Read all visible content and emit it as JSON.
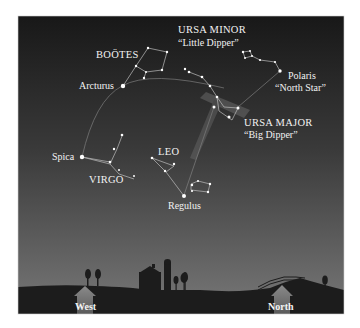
{
  "diagram": {
    "type": "star-chart",
    "colors": {
      "sky_top": "#1a1a1a",
      "sky_bottom": "#6e6e6e",
      "ground": "#1c1c1c",
      "star": "#ffffff",
      "line": "#9a9a9a",
      "arrow": "#7a7a7a"
    },
    "labels": {
      "bootes": "BOÖTES",
      "arcturus": "Arcturus",
      "ursa_minor": "URSA MINOR",
      "little_dipper": "“Little Dipper”",
      "polaris": "Polaris",
      "north_star": "“North Star”",
      "ursa_major": "URSA MAJOR",
      "big_dipper": "“Big Dipper”",
      "spica": "Spica",
      "virgo": "VIRGO",
      "leo": "LEO",
      "regulus": "Regulus"
    },
    "directions": {
      "west": "West",
      "north": "North"
    }
  }
}
